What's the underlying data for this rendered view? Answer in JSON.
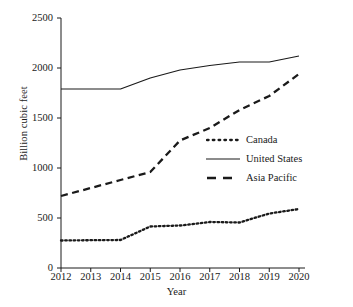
{
  "chart_data": {
    "type": "line",
    "title": "",
    "xlabel": "Year",
    "ylabel": "Billion cubic feet",
    "x": [
      2012,
      2013,
      2014,
      2015,
      2016,
      2017,
      2018,
      2019,
      2020
    ],
    "xtick_labels": [
      "2012",
      "2013",
      "2014",
      "2015",
      "2016",
      "2017",
      "2018",
      "2019",
      "2020"
    ],
    "ytick_labels": [
      "0",
      "500",
      "1000",
      "1500",
      "2000",
      "2500"
    ],
    "yticks": [
      0,
      500,
      1000,
      1500,
      2000,
      2500
    ],
    "ylim": [
      0,
      2500
    ],
    "xlim": [
      2012,
      2020
    ],
    "grid": false,
    "legend_position": "center right",
    "series": [
      {
        "name": "Canada",
        "style": "dotted",
        "color": "#1a1a1a",
        "values": [
          275,
          278,
          280,
          415,
          425,
          460,
          455,
          545,
          590
        ]
      },
      {
        "name": "United States",
        "style": "solid",
        "color": "#1a1a1a",
        "values": [
          1790,
          1790,
          1790,
          1900,
          1980,
          2025,
          2060,
          2060,
          2120
        ]
      },
      {
        "name": "Asia Pacific",
        "style": "dashed",
        "color": "#1a1a1a",
        "values": [
          720,
          800,
          880,
          960,
          1275,
          1400,
          1580,
          1720,
          1940
        ]
      }
    ]
  },
  "legend": {
    "entries": [
      {
        "label": "Canada",
        "style": "dotted"
      },
      {
        "label": "United States",
        "style": "solid"
      },
      {
        "label": "Asia Pacific",
        "style": "dashed"
      }
    ]
  },
  "colors": {
    "ink": "#1a1a1a",
    "background": "#ffffff"
  }
}
